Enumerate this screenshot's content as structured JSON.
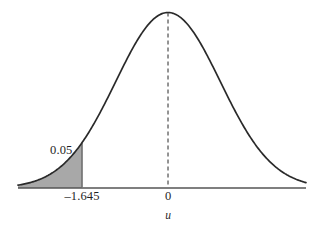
{
  "figure": {
    "background_color": "#ffffff",
    "width": 312,
    "height": 230
  },
  "labels": {
    "area_label": "0.05",
    "tick_critical": "–1.645",
    "tick_zero": "0",
    "axis_label": "u"
  },
  "colors": {
    "curve": "#2a2a2a",
    "axis": "#555555",
    "dashed_line": "#5a5a5a",
    "boundary_line": "#6a6a6a",
    "shaded_area": "#a8a8a8",
    "text": "#1f1f1f"
  },
  "chart_data": {
    "type": "line",
    "title": "",
    "subtitle": "",
    "xlabel": "u",
    "ylabel": "",
    "grid": false,
    "legend": null,
    "distribution": "standard normal density",
    "mean": 0,
    "sd": 1,
    "xlim": [
      -2.87,
      2.64
    ],
    "ylim": [
      0,
      0.4
    ],
    "x_ticks": [
      -1.645,
      0
    ],
    "x_tick_labels": [
      "–1.645",
      "0"
    ],
    "y_ticks": [],
    "y_tick_labels": [],
    "annotations": [
      {
        "text": "0.05",
        "x": -1.95,
        "y": 0.062,
        "describes": "area of shaded left tail"
      }
    ],
    "shaded_regions": [
      {
        "name": "left-tail-rejection-region",
        "from": "-infinity",
        "to": -1.645,
        "area": 0.05,
        "fill": "#a8a8a8"
      }
    ],
    "reference_lines": [
      {
        "name": "mean-dashed-line",
        "x": 0,
        "style": "dashed",
        "from_y": 0,
        "to_y": 0.3989
      },
      {
        "name": "critical-value-line",
        "x": -1.645,
        "style": "solid",
        "from_y": 0,
        "to_y": 0.1031
      }
    ],
    "x": [
      -2.87,
      -2.7,
      -2.53,
      -2.36,
      -2.2,
      -2.03,
      -1.86,
      -1.7,
      -1.645,
      -1.53,
      -1.36,
      -1.2,
      -1.03,
      -0.86,
      -0.69,
      -0.53,
      -0.36,
      -0.19,
      -0.03,
      0.0,
      0.14,
      0.31,
      0.48,
      0.64,
      0.81,
      0.98,
      1.14,
      1.31,
      1.48,
      1.65,
      1.81,
      1.98,
      2.15,
      2.31,
      2.48,
      2.64
    ],
    "y": [
      0.0064,
      0.0104,
      0.0162,
      0.0246,
      0.0355,
      0.0508,
      0.0707,
      0.094,
      0.1031,
      0.1238,
      0.1582,
      0.1942,
      0.2345,
      0.2756,
      0.3144,
      0.3467,
      0.3739,
      0.3918,
      0.3987,
      0.3989,
      0.3951,
      0.3802,
      0.3555,
      0.3251,
      0.2874,
      0.2468,
      0.2083,
      0.1692,
      0.1334,
      0.1023,
      0.0775,
      0.0562,
      0.0395,
      0.0277,
      0.0185,
      0.0122
    ]
  }
}
